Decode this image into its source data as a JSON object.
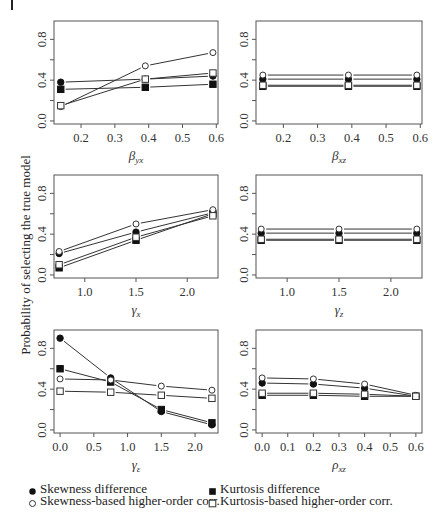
{
  "figure": {
    "ylabel": "Probability of selecting the true model",
    "colors": {
      "line": "#333333",
      "frame": "#555555",
      "marker_fill": "#111111",
      "background": "#ffffff"
    }
  },
  "legend": {
    "items": [
      {
        "label": "Skewness difference",
        "marker": "filled-circle"
      },
      {
        "label": "Kurtosis difference",
        "marker": "filled-square"
      },
      {
        "label": "Skewness-based higher-order corr.",
        "marker": "open-circle"
      },
      {
        "label": "Kurtosis-based higher-order corr.",
        "marker": "open-square"
      }
    ]
  },
  "chart_data": [
    {
      "type": "line",
      "panel": "top-left",
      "xlabel": "β_yx",
      "xlabel_main": "β",
      "xlabel_sub": "yx",
      "ylabel": "Probability of selecting the true model",
      "x": [
        0.14,
        0.39,
        0.59
      ],
      "xticks": [
        0.2,
        0.3,
        0.4,
        0.5,
        0.6
      ],
      "xtick_labels": [
        "0.2",
        "0.3",
        "0.4",
        "0.5",
        "0.6"
      ],
      "xlim": [
        0.12,
        0.605
      ],
      "yticks": [
        0.0,
        0.2,
        0.4,
        0.6,
        0.8
      ],
      "ytick_labels": [
        "0.0",
        "",
        "0.4",
        "",
        "0.8"
      ],
      "ylim": [
        -0.03,
        0.98
      ],
      "grid": false,
      "series": [
        {
          "name": "Skewness difference",
          "marker": "filled-circle",
          "values": [
            0.38,
            0.41,
            0.44
          ]
        },
        {
          "name": "Kurtosis difference",
          "marker": "filled-square",
          "values": [
            0.31,
            0.33,
            0.36
          ]
        },
        {
          "name": "Skewness-based higher-order corr.",
          "marker": "open-circle",
          "values": [
            0.14,
            0.54,
            0.67
          ]
        },
        {
          "name": "Kurtosis-based higher-order corr.",
          "marker": "open-square",
          "values": [
            0.15,
            0.41,
            0.47
          ]
        }
      ]
    },
    {
      "type": "line",
      "panel": "top-right",
      "xlabel": "β_xz",
      "xlabel_main": "β",
      "xlabel_sub": "xz",
      "x": [
        0.14,
        0.39,
        0.59
      ],
      "xticks": [
        0.2,
        0.3,
        0.4,
        0.5,
        0.6
      ],
      "xtick_labels": [
        "0.2",
        "0.3",
        "0.4",
        "0.5",
        "0.6"
      ],
      "xlim": [
        0.12,
        0.605
      ],
      "yticks": [
        0.0,
        0.2,
        0.4,
        0.6,
        0.8
      ],
      "ytick_labels": [
        "0.0",
        "",
        "0.4",
        "",
        "0.8"
      ],
      "ylim": [
        -0.03,
        0.98
      ],
      "grid": false,
      "series": [
        {
          "name": "Skewness difference",
          "marker": "filled-circle",
          "values": [
            0.41,
            0.41,
            0.41
          ]
        },
        {
          "name": "Kurtosis difference",
          "marker": "filled-square",
          "values": [
            0.34,
            0.34,
            0.34
          ]
        },
        {
          "name": "Skewness-based higher-order corr.",
          "marker": "open-circle",
          "values": [
            0.45,
            0.45,
            0.45
          ]
        },
        {
          "name": "Kurtosis-based higher-order corr.",
          "marker": "open-square",
          "values": [
            0.35,
            0.35,
            0.35
          ]
        }
      ]
    },
    {
      "type": "line",
      "panel": "middle-left",
      "xlabel": "γ_x",
      "xlabel_main": "γ",
      "xlabel_sub": "x",
      "x": [
        0.75,
        1.5,
        2.25
      ],
      "xticks": [
        1.0,
        1.5,
        2.0
      ],
      "xtick_labels": [
        "1.0",
        "1.5",
        "2.0"
      ],
      "xlim": [
        0.7,
        2.3
      ],
      "yticks": [
        0.0,
        0.2,
        0.4,
        0.6,
        0.8
      ],
      "ytick_labels": [
        "0.0",
        "",
        "0.4",
        "",
        "0.8"
      ],
      "ylim": [
        -0.03,
        0.98
      ],
      "grid": false,
      "series": [
        {
          "name": "Skewness difference",
          "marker": "filled-circle",
          "values": [
            0.21,
            0.42,
            0.61
          ]
        },
        {
          "name": "Kurtosis difference",
          "marker": "filled-square",
          "values": [
            0.07,
            0.34,
            0.6
          ]
        },
        {
          "name": "Skewness-based higher-order corr.",
          "marker": "open-circle",
          "values": [
            0.23,
            0.5,
            0.64
          ]
        },
        {
          "name": "Kurtosis-based higher-order corr.",
          "marker": "open-square",
          "values": [
            0.1,
            0.37,
            0.58
          ]
        }
      ]
    },
    {
      "type": "line",
      "panel": "middle-right",
      "xlabel": "γ_z",
      "xlabel_main": "γ",
      "xlabel_sub": "z",
      "x": [
        0.75,
        1.5,
        2.25
      ],
      "xticks": [
        1.0,
        1.5,
        2.0
      ],
      "xtick_labels": [
        "1.0",
        "1.5",
        "2.0"
      ],
      "xlim": [
        0.7,
        2.3
      ],
      "yticks": [
        0.0,
        0.2,
        0.4,
        0.6,
        0.8
      ],
      "ytick_labels": [
        "0.0",
        "",
        "0.4",
        "",
        "0.8"
      ],
      "ylim": [
        -0.03,
        0.98
      ],
      "grid": false,
      "series": [
        {
          "name": "Skewness difference",
          "marker": "filled-circle",
          "values": [
            0.41,
            0.41,
            0.41
          ]
        },
        {
          "name": "Kurtosis difference",
          "marker": "filled-square",
          "values": [
            0.34,
            0.34,
            0.34
          ]
        },
        {
          "name": "Skewness-based higher-order corr.",
          "marker": "open-circle",
          "values": [
            0.45,
            0.45,
            0.45
          ]
        },
        {
          "name": "Kurtosis-based higher-order corr.",
          "marker": "open-square",
          "values": [
            0.35,
            0.35,
            0.35
          ]
        }
      ]
    },
    {
      "type": "line",
      "panel": "bottom-left",
      "xlabel": "γ_ε",
      "xlabel_main": "γ",
      "xlabel_sub": "ε",
      "x": [
        0.0,
        0.75,
        1.5,
        2.25
      ],
      "xticks": [
        0.0,
        0.5,
        1.0,
        1.5,
        2.0
      ],
      "xtick_labels": [
        "0.0",
        "0.5",
        "1.0",
        "1.5",
        "2.0"
      ],
      "xlim": [
        -0.09,
        2.34
      ],
      "yticks": [
        0.0,
        0.2,
        0.4,
        0.6,
        0.8
      ],
      "ytick_labels": [
        "0.0",
        "",
        "0.4",
        "",
        "0.8"
      ],
      "ylim": [
        -0.03,
        0.98
      ],
      "grid": false,
      "series": [
        {
          "name": "Skewness difference",
          "marker": "filled-circle",
          "values": [
            0.9,
            0.51,
            0.18,
            0.05
          ]
        },
        {
          "name": "Kurtosis difference",
          "marker": "filled-square",
          "values": [
            0.6,
            0.47,
            0.2,
            0.07
          ]
        },
        {
          "name": "Skewness-based higher-order corr.",
          "marker": "open-circle",
          "values": [
            0.5,
            0.49,
            0.43,
            0.39
          ]
        },
        {
          "name": "Kurtosis-based higher-order corr.",
          "marker": "open-square",
          "values": [
            0.38,
            0.37,
            0.34,
            0.31
          ]
        }
      ]
    },
    {
      "type": "line",
      "panel": "bottom-right",
      "xlabel": "ρ_xz",
      "xlabel_main": "ρ",
      "xlabel_sub": "xz",
      "x": [
        0.0,
        0.2,
        0.4,
        0.6
      ],
      "xticks": [
        0.0,
        0.1,
        0.2,
        0.3,
        0.4,
        0.5,
        0.6
      ],
      "xtick_labels": [
        "0.0",
        "0.1",
        "0.2",
        "0.3",
        "0.4",
        "0.5",
        "0.6"
      ],
      "xlim": [
        -0.024,
        0.624
      ],
      "yticks": [
        0.0,
        0.2,
        0.4,
        0.6,
        0.8
      ],
      "ytick_labels": [
        "0.0",
        "",
        "0.4",
        "",
        "0.8"
      ],
      "ylim": [
        -0.03,
        0.98
      ],
      "grid": false,
      "series": [
        {
          "name": "Skewness difference",
          "marker": "filled-circle",
          "values": [
            0.46,
            0.45,
            0.41,
            0.33
          ]
        },
        {
          "name": "Kurtosis difference",
          "marker": "filled-square",
          "values": [
            0.34,
            0.34,
            0.33,
            0.33
          ]
        },
        {
          "name": "Skewness-based higher-order corr.",
          "marker": "open-circle",
          "values": [
            0.51,
            0.5,
            0.45,
            0.34
          ]
        },
        {
          "name": "Kurtosis-based higher-order corr.",
          "marker": "open-square",
          "values": [
            0.36,
            0.36,
            0.35,
            0.33
          ]
        }
      ]
    }
  ]
}
